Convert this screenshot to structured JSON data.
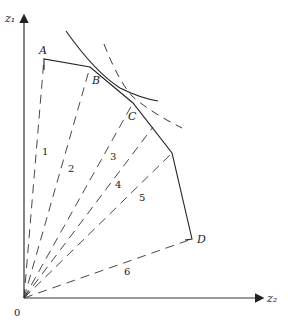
{
  "axes": {
    "y_label": "z₁",
    "x_label": "z₂",
    "origin_label": "0"
  },
  "points": {
    "A": "A",
    "B": "B",
    "C": "C",
    "D": "D"
  },
  "rays": [
    "1",
    "2",
    "3",
    "4",
    "5",
    "6"
  ],
  "colors": {
    "line": "#222222",
    "background": "#ffffff"
  }
}
